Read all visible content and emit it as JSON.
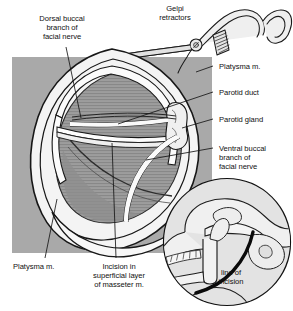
{
  "figure": {
    "kind": "medical-illustration",
    "background_color": "#ffffff",
    "panel_color": "#a8a8a8",
    "muscle_hatch_color": "#9a9a9a",
    "outline_color": "#1a1a1a",
    "tissue_color": "#f2f2f2",
    "inset_fill_color": "#d9d9d9"
  },
  "labels": {
    "dorsal_buccal": {
      "text": "Dorsal buccal\nbranch of\nfacial nerve",
      "align": "center"
    },
    "gelpi": {
      "text": "Gelpi\nretractors",
      "align": "center"
    },
    "platysma_right": {
      "text": "Platysma m.",
      "align": "left"
    },
    "parotid_duct": {
      "text": "Parotid duct",
      "align": "left"
    },
    "parotid_gland": {
      "text": "Parotid gland",
      "align": "left"
    },
    "ventral_buccal": {
      "text": "Ventral buccal\nbranch of\nfacial nerve",
      "align": "left"
    },
    "platysma_bottom": {
      "text": "Platysma m.",
      "align": "left"
    },
    "incision_masseter": {
      "text": "Incision in\nsuperficial layer\nof masseter m.",
      "align": "center"
    },
    "line_of_incision": {
      "text": "line of\nincision",
      "align": "center"
    }
  }
}
